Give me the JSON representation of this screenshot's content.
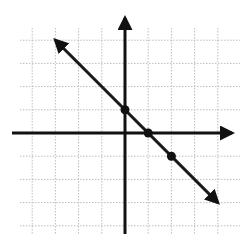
{
  "chart_data": {
    "type": "line",
    "title": "",
    "xlabel": "",
    "ylabel": "",
    "grid": true,
    "xlim": [
      -4,
      4
    ],
    "ylim": [
      -4,
      4
    ],
    "equation": "y = -x + 1",
    "series": [
      {
        "name": "line",
        "x": [
          -3,
          4
        ],
        "y": [
          4,
          -3
        ]
      }
    ],
    "points": [
      {
        "x": 0,
        "y": 1
      },
      {
        "x": 1,
        "y": 0
      },
      {
        "x": 2,
        "y": -1
      }
    ],
    "layout": {
      "origin_px": [
        125,
        133
      ],
      "unit_px": 23.2,
      "grid_color": "#bdbdbd",
      "axis_color": "#111111",
      "line_color": "#1a1a1a"
    }
  }
}
